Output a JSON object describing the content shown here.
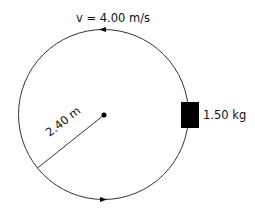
{
  "diagram": {
    "velocity_label": "v = 4.00 m/s",
    "mass_label": "1.50 kg",
    "radius_label": "2.40 m",
    "colors": {
      "line": "#333333",
      "block": "#000000",
      "text": "#111111"
    }
  }
}
